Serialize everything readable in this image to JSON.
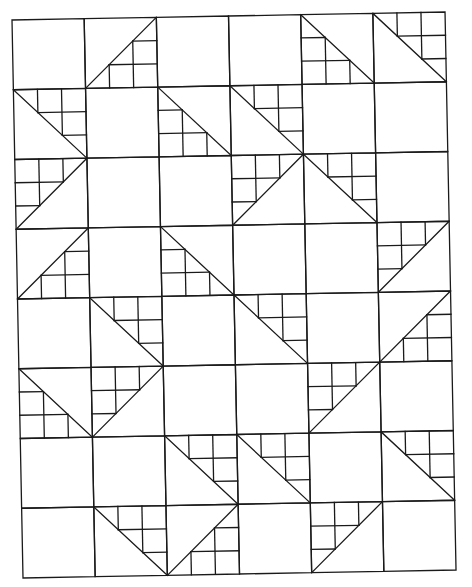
{
  "diagram": {
    "type": "quilt-layout",
    "columns": 6,
    "rows": 8,
    "line_color": "#1a1a1a",
    "background": "#ffffff",
    "legend": {
      "P": "plain square",
      "TR": "half-square with 3x3 staircase of small squares in top-right, diagonal top-left to bottom-right",
      "TL": "half-square with staircase in top-left, diagonal top-right to bottom-left",
      "BR": "half-square with staircase in bottom-right, diagonal top-right to bottom-left",
      "BL": "half-square with staircase in bottom-left, diagonal top-left to bottom-right"
    },
    "grid": [
      [
        "P",
        "BR",
        "P",
        "P",
        "BL",
        "TR"
      ],
      [
        "TR",
        "P",
        "BL",
        "TR",
        "P",
        "P"
      ],
      [
        "TL",
        "P",
        "P",
        "TL",
        "TR",
        "P"
      ],
      [
        "BR",
        "P",
        "BL",
        "P",
        "P",
        "TL"
      ],
      [
        "P",
        "TR",
        "P",
        "TR",
        "P",
        "BR"
      ],
      [
        "BL",
        "TL",
        "P",
        "P",
        "TL",
        "P"
      ],
      [
        "P",
        "P",
        "TR",
        "TR",
        "P",
        "TR"
      ],
      [
        "P",
        "TR",
        "BR",
        "P",
        "TL",
        "P"
      ]
    ]
  }
}
